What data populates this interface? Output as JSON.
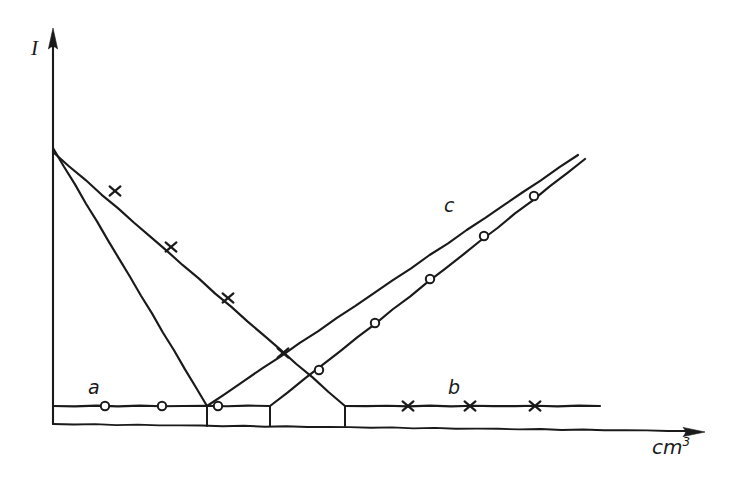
{
  "figure": {
    "kind": "titration-curves",
    "background_color": "#ffffff",
    "ink_color": "#1a1a1a"
  },
  "axes": {
    "y": {
      "label": "I",
      "x_px": 53,
      "top_px": 28,
      "bottom_px": 424,
      "arrow": "up-arrow-icon"
    },
    "x": {
      "label_base": "cm",
      "label_exponent": "3",
      "y_px": 424,
      "left_px": 53,
      "right_px": 705,
      "arrow": "right-arrow-icon"
    }
  },
  "curve_labels": {
    "a": "a",
    "b": "b",
    "c": "c"
  },
  "chart_data": {
    "type": "line",
    "title": "",
    "xlabel": "cm3",
    "ylabel": "I",
    "xlim": [
      0,
      100
    ],
    "ylim": [
      0,
      100
    ],
    "grid": false,
    "legend": "inline-curve-labels",
    "annotations": [
      {
        "text": "a",
        "x_px": 88,
        "y_px": 378,
        "note": "lower-left plateau branch"
      },
      {
        "text": "b",
        "x_px": 448,
        "y_px": 378,
        "note": "lower-right plateau branch"
      },
      {
        "text": "c",
        "x_px": 444,
        "y_px": 196,
        "note": "upper ascending branch"
      }
    ],
    "series": [
      {
        "name": "steep-descending-line",
        "marker": "none",
        "points_px": [
          [
            53,
            148
          ],
          [
            207,
            406
          ]
        ],
        "markers_px": []
      },
      {
        "name": "shallow-descending-line",
        "marker": "cross",
        "points_px": [
          [
            53,
            152
          ],
          [
            345,
            406
          ]
        ],
        "markers_px": [
          [
            115,
            191
          ],
          [
            171,
            247
          ],
          [
            228,
            298
          ],
          [
            283,
            353
          ]
        ]
      },
      {
        "name": "plateau-a",
        "marker": "circle",
        "points_px": [
          [
            53,
            406
          ],
          [
            270,
            406
          ]
        ],
        "markers_px": [
          [
            105,
            406
          ],
          [
            162,
            406
          ],
          [
            218,
            406
          ]
        ]
      },
      {
        "name": "plateau-b",
        "marker": "cross",
        "points_px": [
          [
            345,
            406
          ],
          [
            600,
            406
          ]
        ],
        "markers_px": [
          [
            408,
            406
          ],
          [
            470,
            406
          ],
          [
            535,
            406
          ]
        ]
      },
      {
        "name": "ascending-line-upper",
        "marker": "none",
        "points_px": [
          [
            207,
            406
          ],
          [
            578,
            155
          ]
        ],
        "markers_px": []
      },
      {
        "name": "ascending-line-lower",
        "marker": "circle",
        "points_px": [
          [
            270,
            406
          ],
          [
            585,
            159
          ]
        ],
        "markers_px": [
          [
            319,
            370
          ],
          [
            375,
            323
          ],
          [
            430,
            279
          ],
          [
            484,
            236
          ],
          [
            534,
            196
          ]
        ]
      }
    ],
    "drop_lines_px": [
      {
        "x": 207,
        "y_top": 406,
        "y_bottom": 424
      },
      {
        "x": 270,
        "y_top": 406,
        "y_bottom": 424
      },
      {
        "x": 345,
        "y_top": 406,
        "y_bottom": 424
      }
    ]
  }
}
